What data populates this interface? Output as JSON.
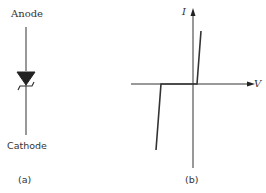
{
  "figure_a": {
    "top_label": "Anode",
    "bottom_label": "Cathode",
    "caption": "(a)",
    "component": "zener-diode-symbol"
  },
  "figure_b": {
    "x_axis_label": "V",
    "y_axis_label": "I",
    "caption": "(b)",
    "curve": "zener-iv-characteristic"
  },
  "colors": {
    "stroke": "#333333",
    "background": "#ffffff"
  }
}
